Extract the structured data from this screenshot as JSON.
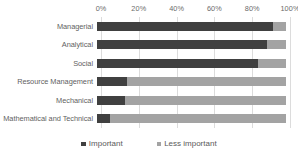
{
  "chart_data": {
    "type": "bar",
    "orientation": "horizontal",
    "stacked": true,
    "stacked_percent": true,
    "title": "",
    "subtitle": "",
    "xlabel": "",
    "ylabel": "",
    "xlim": [
      0,
      100
    ],
    "grid": true,
    "grid_axis": "x",
    "legend_position": "bottom",
    "axis_position": "top",
    "categories": [
      "Managerial",
      "Analytical",
      "Social",
      "Resource Management",
      "Mechanical",
      "Mathematical and Technical"
    ],
    "tick_labels": [
      "0%",
      "20%",
      "40%",
      "60%",
      "80%",
      "100%"
    ],
    "tick_values": [
      0,
      20,
      40,
      60,
      80,
      100
    ],
    "series": [
      {
        "name": "Important",
        "color": "#404040",
        "values": [
          93,
          90,
          85,
          16,
          15,
          7
        ]
      },
      {
        "name": "Less important",
        "color": "#a3a3a3",
        "values": [
          7,
          10,
          15,
          84,
          85,
          93
        ]
      }
    ]
  },
  "legend": {
    "entries": [
      {
        "label": "Important",
        "color": "#404040"
      },
      {
        "label": "Less important",
        "color": "#a3a3a3"
      }
    ]
  }
}
